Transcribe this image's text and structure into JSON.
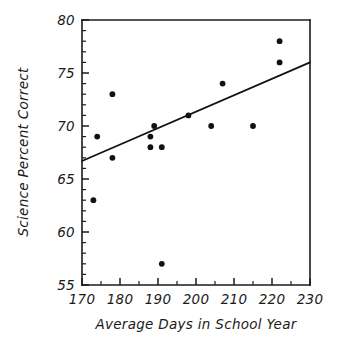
{
  "chart_data": {
    "type": "scatter",
    "title": "",
    "subtitle": "",
    "xlabel": "Average Days in School Year",
    "ylabel": "Science Percent Correct",
    "xlim": [
      170,
      230
    ],
    "ylim": [
      55,
      80
    ],
    "x_major_ticks": [
      170,
      180,
      190,
      200,
      210,
      220,
      230
    ],
    "x_major_tick_labels": [
      "170",
      "180",
      "190",
      "200",
      "210",
      "220",
      "230"
    ],
    "x_minor_ticks": [
      175,
      185,
      195,
      205,
      215,
      225
    ],
    "y_major_ticks": [
      55,
      60,
      65,
      70,
      75,
      80
    ],
    "y_major_tick_labels": [
      "55",
      "60",
      "65",
      "70",
      "75",
      "80"
    ],
    "y_minor_ticks": [
      56,
      57,
      58,
      59,
      61,
      62,
      63,
      64,
      66,
      67,
      68,
      69,
      71,
      72,
      73,
      74,
      76,
      77,
      78,
      79
    ],
    "grid": false,
    "legend": null,
    "legend_position": "none",
    "marker_color": "#111111",
    "line_color": "#111111",
    "axis_color": "#1b1b1b",
    "background_color": "#ffffff",
    "series": [
      {
        "name": "Countries",
        "type": "scatter",
        "points": [
          {
            "x": 173,
            "y": 63
          },
          {
            "x": 174,
            "y": 69
          },
          {
            "x": 178,
            "y": 73
          },
          {
            "x": 178,
            "y": 67
          },
          {
            "x": 188,
            "y": 69
          },
          {
            "x": 188,
            "y": 68
          },
          {
            "x": 189,
            "y": 70
          },
          {
            "x": 191,
            "y": 68
          },
          {
            "x": 191,
            "y": 57
          },
          {
            "x": 198,
            "y": 71
          },
          {
            "x": 204,
            "y": 70
          },
          {
            "x": 207,
            "y": 74
          },
          {
            "x": 215,
            "y": 70
          },
          {
            "x": 222,
            "y": 78
          },
          {
            "x": 222,
            "y": 76
          }
        ]
      },
      {
        "name": "Least-squares regression line",
        "type": "line",
        "endpoints": [
          {
            "x": 170,
            "y": 66.7
          },
          {
            "x": 230,
            "y": 76.0
          }
        ]
      }
    ]
  }
}
